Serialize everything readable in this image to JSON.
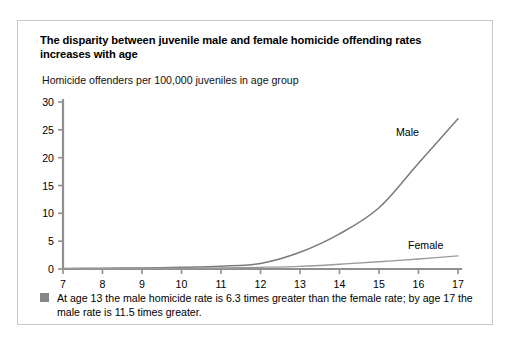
{
  "figure": {
    "title": "The disparity between juvenile male and female homicide offending rates increases with age",
    "footnote": "At age 13 the male homicide rate is 6.3 times greater than the female rate; by age 17 the male rate is 11.5 times greater.",
    "bullet_color": "#868686",
    "border_color": "#c8c8c8"
  },
  "chart_data": {
    "type": "line",
    "title": "The disparity between juvenile male and female homicide offending rates increases with age",
    "subtitle": "Homicide offenders per 100,000 juveniles in age group",
    "xlabel": "",
    "ylabel": "Homicide offenders per 100,000 juveniles in age group",
    "x": [
      7,
      8,
      9,
      10,
      11,
      12,
      13,
      14,
      15,
      16,
      17
    ],
    "xlim": [
      7,
      17
    ],
    "ylim": [
      0,
      30
    ],
    "xticks": [
      "7",
      "8",
      "9",
      "10",
      "11",
      "12",
      "13",
      "14",
      "15",
      "16",
      "17"
    ],
    "yticks": [
      "0",
      "5",
      "10",
      "15",
      "20",
      "25",
      "30"
    ],
    "grid": false,
    "legend": "inline-labels",
    "series": [
      {
        "name": "Male",
        "color": "#7a7a7a",
        "label_position": "upper-right",
        "values": [
          0.1,
          0.15,
          0.2,
          0.3,
          0.5,
          1.0,
          3.0,
          6.3,
          11.0,
          19.0,
          27.0
        ]
      },
      {
        "name": "Female",
        "color": "#9a9a9a",
        "label_position": "lower-right",
        "values": [
          0.05,
          0.07,
          0.1,
          0.12,
          0.18,
          0.3,
          0.48,
          0.85,
          1.3,
          1.8,
          2.35
        ]
      }
    ]
  }
}
